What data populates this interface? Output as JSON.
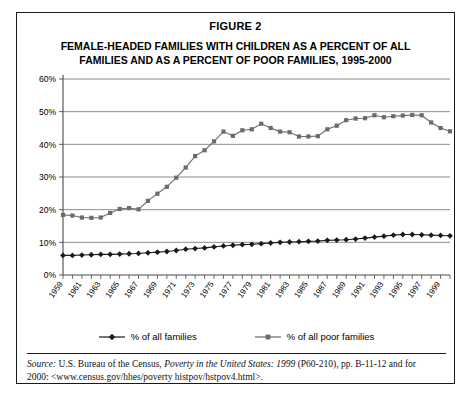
{
  "figure": {
    "label": "FIGURE 2",
    "title_line1": "FEMALE-HEADED FAMILIES WITH CHILDREN AS A PERCENT OF ALL",
    "title_line2": "FAMILIES AND AS A PERCENT OF POOR FAMILIES, 1995-2000"
  },
  "legend": {
    "items": [
      {
        "label": "% of all families",
        "marker": "diamond",
        "color": "#1a1a1a"
      },
      {
        "label": "% of all poor families",
        "marker": "square",
        "color": "#6b6b6b"
      }
    ]
  },
  "source": {
    "prefix": "Source:",
    "text_a": " U.S. Bureau of the Census, ",
    "italic_title": "Poverty in the United States: 1999",
    "text_b": " (P60-210), pp. B-11-12 and for",
    "line2": "2000: <www.census.gov/hhes/poverty histpov/hstpov4.html>."
  },
  "chart_data": {
    "type": "line",
    "title": "FEMALE-HEADED FAMILIES WITH CHILDREN AS A PERCENT OF ALL FAMILIES AND AS A PERCENT OF POOR FAMILIES, 1995-2000",
    "xlabel": "",
    "ylabel": "",
    "ylim": [
      0,
      60
    ],
    "yticks": [
      0,
      10,
      20,
      30,
      40,
      50,
      60
    ],
    "ytick_labels": [
      "0%",
      "10%",
      "20%",
      "30%",
      "40%",
      "50%",
      "60%"
    ],
    "grid": true,
    "legend_position": "bottom",
    "x": [
      1959,
      1960,
      1961,
      1962,
      1963,
      1964,
      1965,
      1966,
      1967,
      1968,
      1969,
      1970,
      1971,
      1972,
      1973,
      1974,
      1975,
      1976,
      1977,
      1978,
      1979,
      1980,
      1981,
      1982,
      1983,
      1984,
      1985,
      1986,
      1987,
      1988,
      1989,
      1990,
      1991,
      1992,
      1993,
      1994,
      1995,
      1996,
      1997,
      1998,
      1999,
      2000
    ],
    "xtick_labels": [
      "1959",
      "1961",
      "1963",
      "1965",
      "1967",
      "1969",
      "1971",
      "1973",
      "1975",
      "1977",
      "1979",
      "1981",
      "1983",
      "1985",
      "1987",
      "1989",
      "1991",
      "1993",
      "1995",
      "1997",
      "1999"
    ],
    "series": [
      {
        "name": "% of all poor families",
        "color": "#6b6b6b",
        "marker": "square",
        "values": [
          18.4,
          18.2,
          17.6,
          17.5,
          17.6,
          19.0,
          20.2,
          20.5,
          20.1,
          22.7,
          24.9,
          27.0,
          29.8,
          32.9,
          36.4,
          38.2,
          40.9,
          43.9,
          42.6,
          44.3,
          44.6,
          46.3,
          45.0,
          43.9,
          43.7,
          42.4,
          42.4,
          42.5,
          44.6,
          45.7,
          47.4,
          47.9,
          48.0,
          48.9,
          48.3,
          48.6,
          48.8,
          49.0,
          48.9,
          46.7,
          45.0,
          44.0
        ]
      },
      {
        "name": "% of all families",
        "color": "#1a1a1a",
        "marker": "diamond",
        "values": [
          6.0,
          6.0,
          6.1,
          6.2,
          6.3,
          6.3,
          6.4,
          6.5,
          6.6,
          6.8,
          7.0,
          7.2,
          7.5,
          7.9,
          8.1,
          8.3,
          8.6,
          8.9,
          9.1,
          9.3,
          9.4,
          9.6,
          9.8,
          10.0,
          10.1,
          10.2,
          10.3,
          10.4,
          10.6,
          10.7,
          10.8,
          11.0,
          11.3,
          11.6,
          11.9,
          12.2,
          12.4,
          12.4,
          12.3,
          12.2,
          12.1,
          12.0
        ]
      }
    ]
  }
}
